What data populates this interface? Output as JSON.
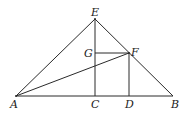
{
  "diagram": {
    "type": "geometry-figure",
    "points": {
      "A": {
        "label": "A",
        "x": 16,
        "y": 96
      },
      "B": {
        "label": "B",
        "x": 173,
        "y": 96
      },
      "C": {
        "label": "C",
        "x": 95,
        "y": 96
      },
      "D": {
        "label": "D",
        "x": 129,
        "y": 96
      },
      "E": {
        "label": "E",
        "x": 95,
        "y": 19
      },
      "F": {
        "label": "F",
        "x": 129,
        "y": 53
      },
      "G": {
        "label": "G",
        "x": 95,
        "y": 53
      }
    },
    "segments": [
      "AB",
      "AE",
      "EB",
      "EC",
      "GF",
      "FD",
      "AF"
    ],
    "colors": {
      "stroke": "#2a2a2a",
      "label": "#222222",
      "background": "#ffffff"
    }
  }
}
